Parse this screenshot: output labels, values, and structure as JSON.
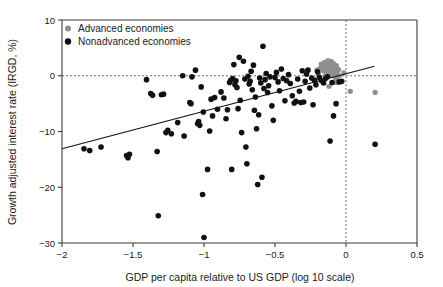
{
  "chart_data": {
    "type": "scatter",
    "title": "",
    "xlabel": "GDP per capita relative to US GDP (log 10 scale)",
    "ylabel": "Growth adjusted interest rate (IRGD, %)",
    "xlim": [
      -2,
      0.5
    ],
    "ylim": [
      -30,
      10
    ],
    "xticks": [
      -2,
      -1.5,
      -1,
      -0.5,
      0,
      0.5
    ],
    "xticklabels": [
      "−2",
      "−1.5",
      "−1",
      "−0.5",
      "0",
      "0.5"
    ],
    "yticks": [
      10,
      0,
      -10,
      -20,
      -30
    ],
    "yticklabels": [
      "10",
      "0",
      "−10",
      "−20",
      "−30"
    ],
    "grid": false,
    "legend_position": "top-left",
    "reference_lines": [
      {
        "name": "zero-irgd-horizontal",
        "orientation": "horizontal",
        "value": 0,
        "style": "dotted"
      },
      {
        "name": "zero-gdp-vertical",
        "orientation": "vertical",
        "value": 0,
        "style": "dashed"
      }
    ],
    "fit_line": {
      "name": "regression-line",
      "x_start": -2.0,
      "y_start": -13.1,
      "x_end": 0.2,
      "y_end": 1.7
    },
    "colors": {
      "advanced": "#8f8f8f",
      "nonadvanced": "#111111",
      "axis": "#3a3a3a",
      "fit_line": "#111111",
      "reference_line": "#6e6e6e",
      "background": "#ffffff"
    },
    "series": [
      {
        "name": "Advanced economies",
        "marker": "circle",
        "color": "#8f8f8f",
        "points": [
          [
            -0.205,
            1.0
          ],
          [
            -0.195,
            0.4
          ],
          [
            -0.185,
            1.3
          ],
          [
            -0.175,
            2.1
          ],
          [
            -0.165,
            1.6
          ],
          [
            -0.16,
            0.9
          ],
          [
            -0.152,
            2.4
          ],
          [
            -0.148,
            1.1
          ],
          [
            -0.142,
            0.2
          ],
          [
            -0.138,
            2.0
          ],
          [
            -0.133,
            1.4
          ],
          [
            -0.128,
            2.7
          ],
          [
            -0.124,
            0.7
          ],
          [
            -0.12,
            1.9
          ],
          [
            -0.116,
            2.3
          ],
          [
            -0.112,
            0.5
          ],
          [
            -0.108,
            1.2
          ],
          [
            -0.104,
            2.6
          ],
          [
            -0.1,
            1.7
          ],
          [
            -0.096,
            0.1
          ],
          [
            -0.092,
            1.0
          ],
          [
            -0.088,
            2.2
          ],
          [
            -0.084,
            0.6
          ],
          [
            -0.08,
            1.5
          ],
          [
            -0.076,
            -0.3
          ],
          [
            -0.072,
            0.8
          ],
          [
            -0.068,
            1.8
          ],
          [
            -0.064,
            -0.6
          ],
          [
            -0.06,
            0.3
          ],
          [
            -0.056,
            -1.1
          ],
          [
            -0.052,
            1.1
          ],
          [
            -0.048,
            0.0
          ],
          [
            -0.12,
            -1.9
          ],
          [
            -0.07,
            -1.2
          ],
          [
            -0.015,
            0.5
          ],
          [
            0.03,
            -2.8
          ],
          [
            0.205,
            -3.0
          ]
        ]
      },
      {
        "name": "Nonadvanced economies",
        "marker": "circle",
        "color": "#111111",
        "points": [
          [
            -1.845,
            -13.1
          ],
          [
            -1.805,
            -13.4
          ],
          [
            -1.725,
            -12.8
          ],
          [
            -1.545,
            -14.3
          ],
          [
            -1.535,
            -14.7
          ],
          [
            -1.525,
            -14.1
          ],
          [
            -1.405,
            -0.7
          ],
          [
            -1.375,
            -3.2
          ],
          [
            -1.362,
            -3.5
          ],
          [
            -1.33,
            -13.6
          ],
          [
            -1.322,
            -25.1
          ],
          [
            -1.3,
            -3.4
          ],
          [
            -1.285,
            -3.3
          ],
          [
            -1.268,
            -10.2
          ],
          [
            -1.255,
            -9.8
          ],
          [
            -1.23,
            -10.4
          ],
          [
            -1.185,
            -8.4
          ],
          [
            -1.15,
            0.0
          ],
          [
            -1.14,
            -10.8
          ],
          [
            -1.1,
            -4.8
          ],
          [
            -1.092,
            -5.0
          ],
          [
            -1.085,
            -0.2
          ],
          [
            -1.06,
            1.0
          ],
          [
            -1.045,
            -8.6
          ],
          [
            -1.038,
            -8.2
          ],
          [
            -1.03,
            -8.9
          ],
          [
            -1.02,
            -2.0
          ],
          [
            -1.01,
            -21.3
          ],
          [
            -1.005,
            -6.5
          ],
          [
            -1.0,
            -29.0
          ],
          [
            -0.975,
            -16.8
          ],
          [
            -0.96,
            -9.9
          ],
          [
            -0.95,
            -4.2
          ],
          [
            -0.94,
            -7.2
          ],
          [
            -0.925,
            -3.9
          ],
          [
            -0.905,
            -6.0
          ],
          [
            -0.88,
            -2.9
          ],
          [
            -0.86,
            -4.0
          ],
          [
            -0.845,
            -7.7
          ],
          [
            -0.835,
            -6.1
          ],
          [
            -0.82,
            -1.2
          ],
          [
            -0.812,
            -0.8
          ],
          [
            -0.805,
            -16.8
          ],
          [
            -0.798,
            -0.5
          ],
          [
            -0.79,
            2.0
          ],
          [
            -0.782,
            -1.6
          ],
          [
            -0.775,
            -0.9
          ],
          [
            -0.768,
            -2.1
          ],
          [
            -0.76,
            -5.9
          ],
          [
            -0.752,
            3.3
          ],
          [
            -0.745,
            -4.4
          ],
          [
            -0.735,
            -10.2
          ],
          [
            -0.722,
            2.6
          ],
          [
            -0.712,
            -0.6
          ],
          [
            -0.705,
            -12.8
          ],
          [
            -0.698,
            -15.8
          ],
          [
            -0.69,
            -0.1
          ],
          [
            -0.682,
            -1.5
          ],
          [
            -0.675,
            -1.0
          ],
          [
            -0.668,
            0.8
          ],
          [
            -0.66,
            -2.5
          ],
          [
            -0.652,
            1.9
          ],
          [
            -0.645,
            -6.2
          ],
          [
            -0.638,
            -3.8
          ],
          [
            -0.63,
            -9.5
          ],
          [
            -0.622,
            -19.5
          ],
          [
            -0.615,
            -7.0
          ],
          [
            -0.608,
            -0.4
          ],
          [
            -0.6,
            -1.3
          ],
          [
            -0.592,
            -18.2
          ],
          [
            -0.585,
            5.3
          ],
          [
            -0.578,
            -2.3
          ],
          [
            -0.57,
            -0.7
          ],
          [
            -0.562,
            0.4
          ],
          [
            -0.552,
            -3.0
          ],
          [
            -0.545,
            -1.8
          ],
          [
            -0.535,
            -0.2
          ],
          [
            -0.522,
            -5.4
          ],
          [
            -0.512,
            -8.0
          ],
          [
            -0.5,
            -0.3
          ],
          [
            -0.49,
            0.6
          ],
          [
            -0.478,
            -1.1
          ],
          [
            -0.468,
            -2.7
          ],
          [
            -0.455,
            1.2
          ],
          [
            -0.442,
            -0.5
          ],
          [
            -0.43,
            -4.5
          ],
          [
            -0.418,
            -0.9
          ],
          [
            -0.405,
            0.2
          ],
          [
            -0.392,
            -1.4
          ],
          [
            -0.378,
            -3.6
          ],
          [
            -0.365,
            -4.9
          ],
          [
            -0.352,
            -4.6
          ],
          [
            -0.34,
            -0.6
          ],
          [
            -0.328,
            -2.8
          ],
          [
            -0.318,
            -4.8
          ],
          [
            -0.308,
            0.9
          ],
          [
            -0.298,
            -4.7
          ],
          [
            -0.288,
            -1.0
          ],
          [
            -0.278,
            0.3
          ],
          [
            -0.268,
            1.0
          ],
          [
            -0.255,
            -2.2
          ],
          [
            -0.242,
            -0.4
          ],
          [
            -0.232,
            -5.2
          ],
          [
            -0.222,
            -0.8
          ],
          [
            -0.212,
            -1.6
          ],
          [
            -0.2,
            0.7
          ],
          [
            -0.188,
            -0.3
          ],
          [
            -0.172,
            -0.9
          ],
          [
            -0.158,
            -1.3
          ],
          [
            -0.145,
            -0.5
          ],
          [
            -0.13,
            -0.2
          ],
          [
            -0.112,
            -11.7
          ],
          [
            -0.098,
            -1.2
          ],
          [
            -0.088,
            -7.2
          ],
          [
            -0.07,
            -5.0
          ],
          [
            -0.048,
            -1.1
          ],
          [
            -0.03,
            -1.0
          ],
          [
            0.205,
            -12.3
          ]
        ]
      }
    ]
  },
  "legend": {
    "items": [
      {
        "label": "Advanced economies",
        "color": "#8f8f8f"
      },
      {
        "label": "Nonadvanced economies",
        "color": "#111111"
      }
    ]
  }
}
